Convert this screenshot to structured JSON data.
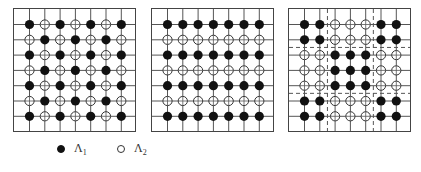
{
  "figure": {
    "grid_size": 7,
    "colors": {
      "filled": "#111111",
      "open": "#ffffff",
      "line": "#555555",
      "dashed": "#555555"
    },
    "panels": [
      {
        "id": "checkerboard",
        "pattern": [
          "FOFOFOF",
          "OFOFOFO",
          "FOFOFOF",
          "OFOFOFO",
          "FOFOFOF",
          "OFOFOFO",
          "FOFOFOF"
        ],
        "dashed_cols": [],
        "dashed_rows": []
      },
      {
        "id": "stripes",
        "pattern": [
          "FFFFFFF",
          "OOOOOOO",
          "FFFFFFF",
          "OOOOOOO",
          "FFFFFFF",
          "OOOOOOO",
          "FFFFFFF"
        ],
        "dashed_cols": [],
        "dashed_rows": []
      },
      {
        "id": "blocks",
        "pattern": [
          "FFOOOFF",
          "FFOOOFF",
          "OOFFFOO",
          "OOFFFOO",
          "OOFFFOO",
          "FFOOOFF",
          "FFOOOFF"
        ],
        "dashed_cols": [
          1.5,
          4.5
        ],
        "dashed_rows": [
          1.5,
          4.5
        ]
      }
    ]
  },
  "legend": {
    "items": [
      {
        "symbol": "filled-circle",
        "label": "Λ",
        "sub": "1"
      },
      {
        "symbol": "open-circle",
        "label": "Λ",
        "sub": "2"
      }
    ]
  }
}
